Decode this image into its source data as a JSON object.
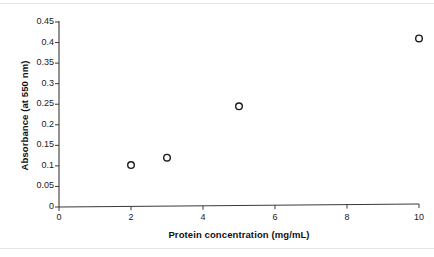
{
  "chart_data": {
    "type": "scatter",
    "title": "",
    "xlabel": "Protein concentration (mg/mL)",
    "ylabel": "Absorbance (at 550 nm)",
    "xlim": [
      0,
      10
    ],
    "ylim": [
      0,
      0.45
    ],
    "grid": false,
    "legend": "none",
    "marker": "open-circle",
    "marker_color": "#1a1a1a",
    "axis_color": "#3a3a3a",
    "xticks": [
      0,
      2,
      4,
      6,
      8,
      10
    ],
    "xtick_labels": [
      "0",
      "2",
      "4",
      "6",
      "8",
      "10"
    ],
    "yticks": [
      0,
      0.05,
      0.1,
      0.15,
      0.2,
      0.25,
      0.3,
      0.35,
      0.4,
      0.45
    ],
    "ytick_labels": [
      "0",
      "0.05",
      "0.1",
      "0.15",
      "0.2",
      "0.25",
      "0.3",
      "0.35",
      "0.4",
      "0.45"
    ],
    "x": [
      2,
      3,
      5,
      10
    ],
    "y": [
      0.102,
      0.12,
      0.245,
      0.41
    ],
    "points": [
      {
        "x": 2,
        "y": 0.102
      },
      {
        "x": 3,
        "y": 0.12
      },
      {
        "x": 5,
        "y": 0.245
      },
      {
        "x": 10,
        "y": 0.41
      }
    ]
  },
  "figure": {
    "background": "#ffffff",
    "rule_color": "#e5e6e8"
  }
}
